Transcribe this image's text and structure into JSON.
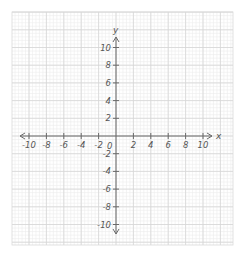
{
  "diagram": {
    "type": "coordinate-plane",
    "axes": {
      "x_label": "x",
      "y_label": "y",
      "x_range": [
        -10,
        10
      ],
      "y_range": [
        -10,
        10
      ],
      "tick_step": 2
    },
    "x_tick_labels": [
      "-10",
      "-8",
      "-6",
      "-4",
      "-2",
      "2",
      "4",
      "6",
      "8",
      "10"
    ],
    "y_tick_labels": [
      "10",
      "8",
      "6",
      "4",
      "2",
      "-2",
      "-4",
      "-6",
      "-8",
      "-10"
    ],
    "origin_label": "0",
    "colors": {
      "background": "#ffffff",
      "minor_grid": "#ececec",
      "major_grid": "#d6d6d6",
      "axis": "#6a6a6a",
      "label": "#555555"
    }
  }
}
